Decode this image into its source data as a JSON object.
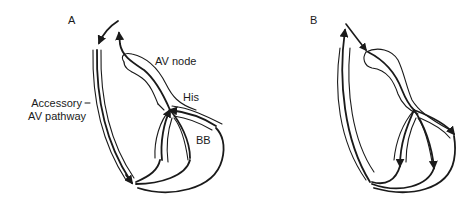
{
  "figure": {
    "panels": [
      {
        "id": "A",
        "label": "A",
        "annotations": {
          "av_node": "AV node",
          "his": "His",
          "bb": "BB",
          "accessory_line1": "Accessory",
          "accessory_line2": "AV pathway"
        }
      },
      {
        "id": "B",
        "label": "B"
      }
    ],
    "colors": {
      "stroke": "#1a1a1a",
      "background": "#ffffff"
    }
  }
}
